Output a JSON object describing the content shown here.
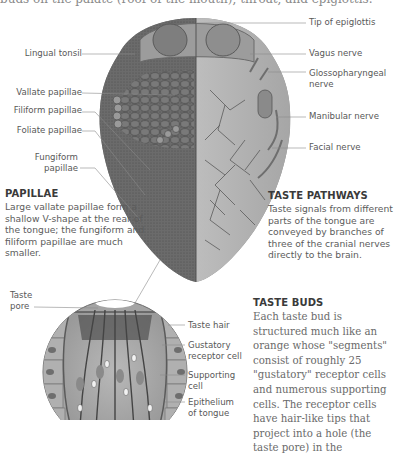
{
  "top_caption": "buds on the palate (roof of the mouth), throat, and epiglottis.",
  "tongue_labels": {
    "left": [
      {
        "id": "lingual-tonsil",
        "text": "Lingual tonsil"
      },
      {
        "id": "vallate-papillae",
        "text": "Vallate papillae"
      },
      {
        "id": "filiform-papillae",
        "text": "Filiform papillae"
      },
      {
        "id": "foliate-papillae",
        "text": "Foliate papillae"
      },
      {
        "id": "fungiform-papillae",
        "text": "Fungiform\npapillae"
      }
    ],
    "right": [
      {
        "id": "tip-of-epiglottis",
        "text": "Tip of epiglottis"
      },
      {
        "id": "vagus-nerve",
        "text": "Vagus nerve"
      },
      {
        "id": "glossopharyngeal-nerve",
        "text": "Glossopharyngeal\nnerve"
      },
      {
        "id": "manibular-nerve",
        "text": "Manibular nerve"
      },
      {
        "id": "facial-nerve",
        "text": "Facial nerve"
      }
    ]
  },
  "papillae": {
    "heading": "PAPILLAE",
    "body": "Large vallate papillae form a shallow V-shape at the rear of the tongue; the fungiform and filiform papillae are much smaller."
  },
  "taste_pathways": {
    "heading": "TASTE PATHWAYS",
    "body": "Taste signals from different parts of the tongue are conveyed by branches of three of the cranial nerves directly to the brain."
  },
  "taste_bud_labels": {
    "left": [
      {
        "id": "taste-pore",
        "text": "Taste\npore"
      }
    ],
    "right": [
      {
        "id": "taste-hair",
        "text": "Taste hair"
      },
      {
        "id": "gustatory-receptor-cell",
        "text": "Gustatory\nreceptor cell"
      },
      {
        "id": "supporting-cell",
        "text": "Supporting\ncell"
      },
      {
        "id": "epithelium-of-tongue",
        "text": "Epithelium\nof tongue"
      }
    ]
  },
  "taste_buds": {
    "heading": "TASTE BUDS",
    "body": "Each taste bud is structured much like an orange whose \"segments\" consist of roughly 25 \"gustatory\" receptor cells and numerous supporting cells. The receptor cells have hair-like tips that project into a hole (the taste pore) in the"
  }
}
